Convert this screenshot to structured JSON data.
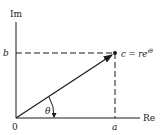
{
  "diagram": {
    "type": "complex-plane-vector",
    "axes": {
      "y_label": "Im",
      "x_label": "Re",
      "origin_label": "0"
    },
    "point": {
      "label": "c = re",
      "exponent": "iθ",
      "x_label": "a",
      "y_label": "b"
    },
    "angle_label": "θ",
    "colors": {
      "ink": "#1a1a1a",
      "background": "#ffffff"
    }
  }
}
